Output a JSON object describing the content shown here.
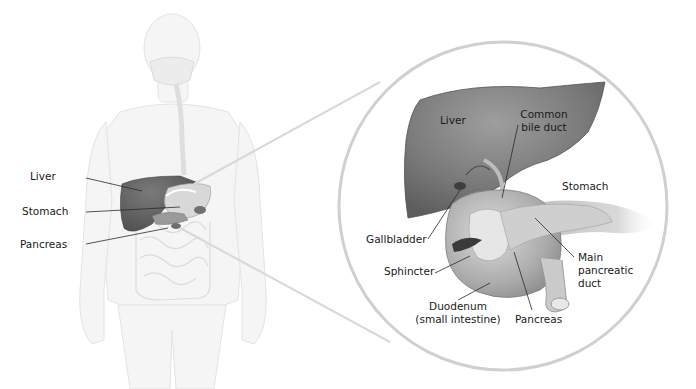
{
  "figure": {
    "colors": {
      "body_outline": "#e4e4e4",
      "body_fill": "#f4f4f4",
      "organ_dark": "#6f6f6f",
      "organ_mid": "#9a9a9a",
      "organ_light": "#cfcfcf",
      "leader_line": "#2a2a2a",
      "zoom_circle": "#d2d2d2",
      "text": "#1a1a1a"
    }
  },
  "body_labels": {
    "liver": "Liver",
    "stomach": "Stomach",
    "pancreas": "Pancreas"
  },
  "detail_labels": {
    "liver": "Liver",
    "common_bile_duct_1": "Common",
    "common_bile_duct_2": "bile duct",
    "stomach": "Stomach",
    "gallbladder": "Gallbladder",
    "sphincter": "Sphincter",
    "main_pancreatic_duct_1": "Main",
    "main_pancreatic_duct_2": "pancreatic",
    "main_pancreatic_duct_3": "duct",
    "duodenum_1": "Duodenum",
    "duodenum_2": "(small intestine)",
    "pancreas": "Pancreas"
  }
}
